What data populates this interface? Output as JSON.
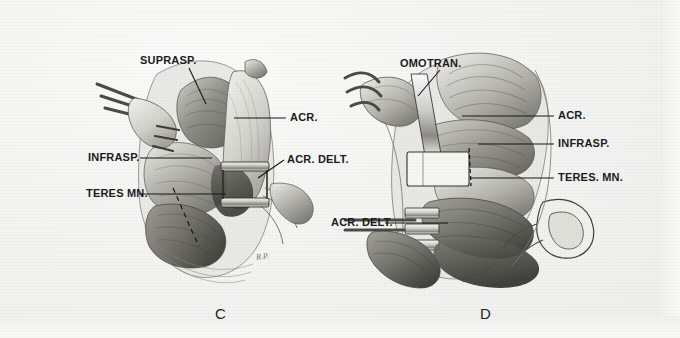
{
  "figure": {
    "kind": "anatomical-surgical-illustration",
    "medium": "pencil drawing on paper, scanned book plate",
    "background_color": "#f4f4f2",
    "ink_color": "#1b1b1b",
    "panel_count": 2
  },
  "panels": [
    {
      "letter": "C",
      "view": "posterior shoulder dissection, suprascapular exposure",
      "labels": [
        {
          "text": "SUPRASP.",
          "meaning": "supraspinatus muscle",
          "side": "left",
          "x": 140,
          "y": 60
        },
        {
          "text": "ACR.",
          "meaning": "acromion",
          "side": "right",
          "x": 288,
          "y": 112
        },
        {
          "text": "INFRASP.",
          "meaning": "infraspinatus muscle",
          "side": "left",
          "x": 88,
          "y": 152
        },
        {
          "text": "ACR. DELT.",
          "meaning": "acromial part of deltoid",
          "side": "right",
          "x": 286,
          "y": 158
        },
        {
          "text": "TERES MN.",
          "meaning": "teres minor muscle",
          "side": "left",
          "x": 86,
          "y": 188
        }
      ]
    },
    {
      "letter": "D",
      "view": "posterior shoulder dissection, omotransversarius exposure",
      "labels": [
        {
          "text": "OMOTRAN.",
          "meaning": "omotransversarius muscle",
          "side": "left",
          "x": 400,
          "y": 60
        },
        {
          "text": "ACR.",
          "meaning": "acromion",
          "side": "right",
          "x": 556,
          "y": 110
        },
        {
          "text": "INFRASP.",
          "meaning": "infraspinatus muscle",
          "side": "right",
          "x": 556,
          "y": 138
        },
        {
          "text": "TERES. MN.",
          "meaning": "teres minor muscle",
          "side": "right",
          "x": 556,
          "y": 172
        },
        {
          "text": "ACR. DELT.",
          "meaning": "acromial part of deltoid",
          "side": "left",
          "x": 331,
          "y": 217
        }
      ]
    }
  ],
  "panel_letters": {
    "left": "C",
    "right": "D"
  },
  "signatures": [
    {
      "text": "R.P.",
      "panel": "C"
    },
    {
      "text": "R.P.",
      "panel": "D"
    }
  ]
}
